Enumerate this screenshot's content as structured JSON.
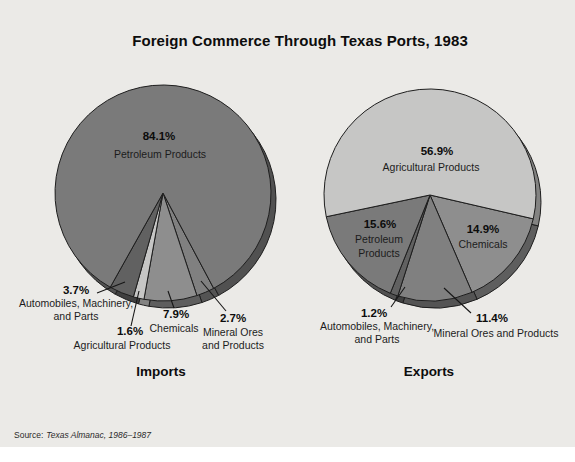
{
  "title": "Foreign Commerce Through Texas Ports, 1983",
  "source": {
    "prefix": "Source:",
    "citation": "Texas Almanac, 1986–1987"
  },
  "palette": {
    "panel_bg": "#ebeae7",
    "page_bg": "#ffffff",
    "outline": "#1e1e1e",
    "leader_color": "#161616",
    "shadow_factor": 0.66
  },
  "chart_data": [
    {
      "type": "pie",
      "title": "Imports",
      "center": [
        163,
        193
      ],
      "radius": 108,
      "shadow_offset": [
        5,
        7
      ],
      "start_angle_deg": 62,
      "caption_pos": [
        161,
        364
      ],
      "slices": [
        {
          "label": "Mineral Ores and Products",
          "value": 2.7,
          "color": "#808080"
        },
        {
          "label": "Chemicals",
          "value": 7.9,
          "color": "#8e8e8e"
        },
        {
          "label": "Agricultural Products",
          "value": 1.6,
          "color": "#c6c6c5"
        },
        {
          "label": "Automobiles, Machinery, and Parts",
          "value": 3.7,
          "color": "#616161"
        },
        {
          "label": "Petroleum Products",
          "value": 84.1,
          "color": "#7a7a7a"
        }
      ],
      "annotations": [
        {
          "pct_text": "84.1%",
          "pct_pos": [
            159,
            140
          ],
          "name_lines": [
            "Petroleum Products"
          ],
          "name_pos": [
            160,
            158
          ],
          "line_h": 13,
          "leader": null
        },
        {
          "pct_text": "3.7%",
          "pct_pos": [
            76,
            294
          ],
          "name_lines": [
            "Automobiles, Machinery,",
            "and Parts"
          ],
          "name_pos": [
            76,
            307
          ],
          "line_h": 13,
          "leader": [
            125,
            282,
            97,
            293
          ]
        },
        {
          "pct_text": "1.6%",
          "pct_pos": [
            130,
            335
          ],
          "name_lines": [
            "Agricultural Products"
          ],
          "name_pos": [
            122,
            349
          ],
          "line_h": 13,
          "leader": [
            139,
            291,
            131,
            326
          ]
        },
        {
          "pct_text": "7.9%",
          "pct_pos": [
            176,
            318
          ],
          "name_lines": [
            "Chemicals"
          ],
          "name_pos": [
            174,
            332
          ],
          "line_h": 13,
          "leader": [
            168,
            291,
            174,
            308
          ]
        },
        {
          "pct_text": "2.7%",
          "pct_pos": [
            233,
            322
          ],
          "name_lines": [
            "Mineral Ores",
            "and Products"
          ],
          "name_pos": [
            233,
            336
          ],
          "line_h": 13,
          "leader": [
            201,
            281,
            226,
            311
          ]
        }
      ]
    },
    {
      "type": "pie",
      "title": "Exports",
      "center": [
        430,
        195
      ],
      "radius": 106,
      "shadow_offset": [
        5,
        7
      ],
      "start_angle_deg": 13,
      "caption_pos": [
        429,
        364
      ],
      "slices": [
        {
          "label": "Chemicals",
          "value": 14.9,
          "color": "#8e8e8e"
        },
        {
          "label": "Mineral Ores and Products",
          "value": 11.4,
          "color": "#808080"
        },
        {
          "label": "Automobiles, Machinery, and Parts",
          "value": 1.2,
          "color": "#616161"
        },
        {
          "label": "Petroleum Products",
          "value": 15.6,
          "color": "#7a7a7a"
        },
        {
          "label": "Agricultural Products",
          "value": 56.9,
          "color": "#c6c6c5"
        }
      ],
      "annotations": [
        {
          "pct_text": "56.9%",
          "pct_pos": [
            437,
            155
          ],
          "name_lines": [
            "Agricultural Products"
          ],
          "name_pos": [
            431,
            171
          ],
          "line_h": 13,
          "leader": null
        },
        {
          "pct_text": "15.6%",
          "pct_pos": [
            380,
            228
          ],
          "name_lines": [
            "Petroleum",
            "Products"
          ],
          "name_pos": [
            379,
            243
          ],
          "line_h": 14,
          "leader": null
        },
        {
          "pct_text": "14.9%",
          "pct_pos": [
            483,
            233
          ],
          "name_lines": [
            "Chemicals"
          ],
          "name_pos": [
            483,
            248
          ],
          "line_h": 13,
          "leader": null
        },
        {
          "pct_text": "1.2%",
          "pct_pos": [
            374,
            317
          ],
          "name_lines": [
            "Automobiles, Machinery,",
            "and Parts"
          ],
          "name_pos": [
            377,
            330
          ],
          "line_h": 13,
          "leader": [
            405,
            287,
            391,
            307
          ]
        },
        {
          "pct_text": "11.4%",
          "pct_pos": [
            492,
            322
          ],
          "name_lines": [
            "Mineral Ores and Products"
          ],
          "name_pos": [
            496,
            337
          ],
          "line_h": 13,
          "leader": [
            444,
            288,
            471,
            313
          ]
        }
      ]
    }
  ]
}
